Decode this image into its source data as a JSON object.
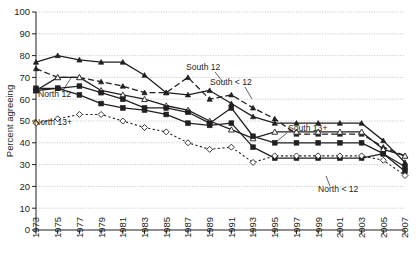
{
  "figure": {
    "type": "line-chart",
    "ylabel": "Percent agreeing",
    "yticks": [
      "0",
      "10",
      "20",
      "30",
      "40",
      "50",
      "60",
      "70",
      "80",
      "90",
      "100"
    ],
    "xticks": [
      "1973",
      "1975",
      "1977",
      "1979",
      "1981",
      "1983",
      "1985",
      "1987",
      "1989",
      "1991",
      "1993",
      "1995",
      "1997",
      "1999",
      "2001",
      "2003",
      "2005",
      "2007"
    ],
    "annotations": {
      "south_12": "South 12",
      "south_lt12": "South < 12",
      "south_13plus": "South 13+",
      "north_12": "North 12",
      "north_13plus": "North 13+",
      "north_lt12": "North < 12"
    }
  },
  "chart_data": {
    "type": "line",
    "title": "",
    "xlabel": "",
    "ylabel": "Percent agreeing",
    "ylim": [
      0,
      100
    ],
    "grid": true,
    "legend": "inline-annotations",
    "x": [
      1973,
      1975,
      1977,
      1979,
      1981,
      1983,
      1985,
      1987,
      1989,
      1991,
      1993,
      1995,
      1997,
      1999,
      2001,
      2003,
      2005,
      2007
    ],
    "series": [
      {
        "name": "South < 12",
        "marker": "triangle-filled",
        "line": "solid",
        "values": [
          77,
          80,
          78,
          77,
          77,
          71,
          63,
          62,
          64,
          58,
          52,
          49,
          49,
          49,
          49,
          49,
          41,
          31
        ]
      },
      {
        "name": "South 12",
        "marker": "triangle-filled",
        "line": "dashed",
        "values": [
          74,
          70,
          70,
          68,
          66,
          63,
          63,
          70,
          60,
          62,
          56,
          51,
          44,
          44,
          44,
          44,
          38,
          34
        ]
      },
      {
        "name": "South 13+",
        "marker": "triangle-open",
        "line": "solid",
        "values": [
          64,
          70,
          70,
          64,
          62,
          60,
          57,
          55,
          50,
          46,
          42,
          45,
          45,
          45,
          45,
          45,
          37,
          34
        ]
      },
      {
        "name": "North 12",
        "marker": "square-filled",
        "line": "solid",
        "values": [
          65,
          65,
          66,
          63,
          60,
          56,
          56,
          54,
          49,
          56,
          43,
          40,
          40,
          40,
          40,
          40,
          35,
          29
        ]
      },
      {
        "name": "North < 12",
        "marker": "square-filled",
        "line": "solid",
        "values": [
          64,
          65,
          62,
          58,
          56,
          55,
          53,
          49,
          48,
          49,
          38,
          33,
          33,
          33,
          33,
          33,
          35,
          27
        ]
      },
      {
        "name": "North 13+",
        "marker": "diamond-open",
        "line": "dotted",
        "values": [
          49,
          51,
          53,
          53,
          50,
          47,
          45,
          40,
          37,
          38,
          31,
          34,
          34,
          34,
          34,
          34,
          32,
          25
        ]
      }
    ]
  }
}
